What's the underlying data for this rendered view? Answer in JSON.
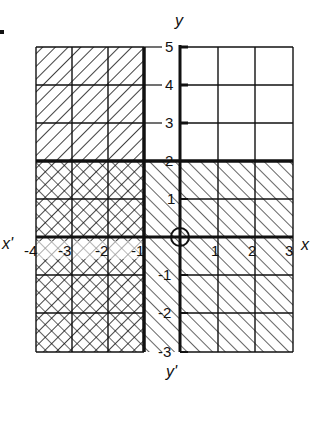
{
  "diagram": {
    "title": "",
    "axes": {
      "x_label": "x",
      "x_neg_label": "x'",
      "y_label": "y",
      "y_neg_label": "y'",
      "origin_label": "O",
      "x_ticks": [
        "-4",
        "-3",
        "-2",
        "-1",
        "1",
        "2",
        "3"
      ],
      "y_ticks": [
        "5",
        "4",
        "3",
        "2",
        "1",
        "-1",
        "-2",
        "-3"
      ]
    },
    "regions": [
      {
        "name": "x <= -1",
        "hatch": "backslash",
        "description": "Left of thick line x = -1"
      },
      {
        "name": "y <= 2",
        "hatch": "forward-slash",
        "description": "Below thick line y = 2"
      },
      {
        "name": "x <= -1 and y <= 2",
        "hatch": "cross-hatch",
        "description": "Intersection of both regions"
      }
    ],
    "boundary_lines": [
      "x = -1",
      "y = 2"
    ],
    "colors": {
      "ink": "#111111",
      "background": "#ffffff"
    }
  }
}
